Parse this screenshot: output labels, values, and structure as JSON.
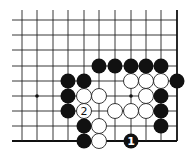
{
  "diagram": {
    "type": "go-board-partial",
    "view": "lower-right corner, right and bottom edges shown",
    "columns": 11,
    "rows": 9,
    "grid": {
      "col_x": [
        22,
        37,
        53,
        68,
        84,
        99,
        115,
        131,
        146,
        161,
        177
      ],
      "row_y": [
        20,
        35,
        50,
        66,
        81,
        96,
        111,
        126,
        141
      ],
      "line_start_x": 12,
      "line_start_y": 10,
      "right_edge_col": 10,
      "bottom_edge_row": 8
    },
    "stone_radius": 7.5,
    "colors": {
      "black": "#111111",
      "white": "#ffffff",
      "line": "#222222"
    },
    "star_points": [
      {
        "col": 1,
        "row": 5
      },
      {
        "col": 7,
        "row": 5
      }
    ],
    "black_stones": [
      {
        "col": 5,
        "row": 3
      },
      {
        "col": 6,
        "row": 3
      },
      {
        "col": 7,
        "row": 3
      },
      {
        "col": 8,
        "row": 3
      },
      {
        "col": 9,
        "row": 3
      },
      {
        "col": 3,
        "row": 4
      },
      {
        "col": 4,
        "row": 4
      },
      {
        "col": 10,
        "row": 4
      },
      {
        "col": 3,
        "row": 5
      },
      {
        "col": 9,
        "row": 5
      },
      {
        "col": 3,
        "row": 6
      },
      {
        "col": 9,
        "row": 6
      },
      {
        "col": 4,
        "row": 7
      },
      {
        "col": 9,
        "row": 7
      },
      {
        "col": 4,
        "row": 8
      },
      {
        "col": 7,
        "row": 8,
        "label": "1"
      }
    ],
    "white_stones": [
      {
        "col": 7,
        "row": 4
      },
      {
        "col": 8,
        "row": 4
      },
      {
        "col": 9,
        "row": 4
      },
      {
        "col": 4,
        "row": 5
      },
      {
        "col": 5,
        "row": 5
      },
      {
        "col": 8,
        "row": 5
      },
      {
        "col": 4,
        "row": 6,
        "label": "2"
      },
      {
        "col": 6,
        "row": 6
      },
      {
        "col": 7,
        "row": 6
      },
      {
        "col": 8,
        "row": 6
      },
      {
        "col": 5,
        "row": 7
      },
      {
        "col": 5,
        "row": 8
      }
    ],
    "move_labels": [
      "1",
      "2"
    ]
  }
}
